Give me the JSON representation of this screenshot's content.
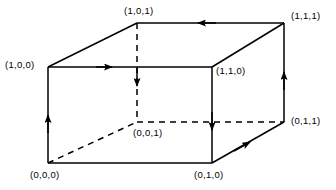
{
  "figure": {
    "name": "unit-cube-oriented-edges",
    "width": 336,
    "height": 190,
    "background_color": "#ffffff",
    "line_color": "#000000",
    "text_color": "#000000"
  },
  "labels": {
    "back_top_left": "(1,0,1)",
    "back_top_right": "(1,1,1)",
    "front_top_left": "(1,0,0)",
    "front_top_right": "(1,1,0)",
    "back_bottom_right": "(0,1,1)",
    "hidden_center": "(0,0,1)",
    "front_bottom_left": "(0,0,0)",
    "front_bottom_right": "(0,1,0)"
  },
  "vertices": [
    {
      "name": "front-top-left",
      "label": "(1,0,0)",
      "x": 48,
      "y": 67
    },
    {
      "name": "front-top-right",
      "label": "(1,1,0)",
      "x": 212,
      "y": 67
    },
    {
      "name": "front-bottom-right",
      "label": "(0,1,0)",
      "x": 212,
      "y": 163
    },
    {
      "name": "front-bottom-left",
      "label": "(0,0,0)",
      "x": 48,
      "y": 163
    },
    {
      "name": "back-top-left",
      "label": "(1,0,1)",
      "x": 137,
      "y": 23
    },
    {
      "name": "back-top-right",
      "label": "(1,1,1)",
      "x": 284,
      "y": 23
    },
    {
      "name": "back-bottom-right",
      "label": "(0,1,1)",
      "x": 284,
      "y": 122
    },
    {
      "name": "back-bottom-hidden",
      "label": "(0,0,1)",
      "x": 137,
      "y": 122
    }
  ],
  "edges": [
    {
      "name": "front-top",
      "style": "solid",
      "from": "(1,0,0)",
      "to": "(1,1,0)",
      "arrow": "forward"
    },
    {
      "name": "front-right-vertical",
      "style": "solid",
      "from": "(1,1,0)",
      "to": "(0,1,0)",
      "arrow": "forward"
    },
    {
      "name": "front-bottom",
      "style": "solid",
      "from": "(0,0,0)",
      "to": "(0,1,0)",
      "arrow": "none"
    },
    {
      "name": "front-left-vertical",
      "style": "solid",
      "from": "(0,0,0)",
      "to": "(1,0,0)",
      "arrow": "forward"
    },
    {
      "name": "back-top",
      "style": "solid",
      "from": "(1,1,1)",
      "to": "(1,0,1)",
      "arrow": "forward"
    },
    {
      "name": "back-right-vertical",
      "style": "solid",
      "from": "(0,1,1)",
      "to": "(1,1,1)",
      "arrow": "forward"
    },
    {
      "name": "top-left-diagonal",
      "style": "solid",
      "from": "(1,0,0)",
      "to": "(1,0,1)",
      "arrow": "none"
    },
    {
      "name": "top-right-diagonal",
      "style": "solid",
      "from": "(1,1,0)",
      "to": "(1,1,1)",
      "arrow": "none"
    },
    {
      "name": "bottom-right-diagonal",
      "style": "solid",
      "from": "(0,1,0)",
      "to": "(0,1,1)",
      "arrow": "forward"
    },
    {
      "name": "hidden-vertical",
      "style": "dashed",
      "from": "(1,0,1)",
      "to": "(0,0,1)",
      "arrow": "forward"
    },
    {
      "name": "hidden-back-bottom",
      "style": "dashed",
      "from": "(0,0,1)",
      "to": "(0,1,1)",
      "arrow": "none"
    },
    {
      "name": "hidden-left-diagonal",
      "style": "dashed",
      "from": "(0,0,0)",
      "to": "(0,0,1)",
      "arrow": "none"
    }
  ]
}
